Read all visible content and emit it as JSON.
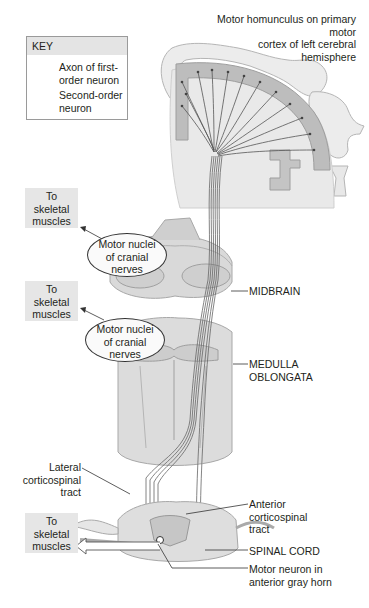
{
  "figure": {
    "title_label": "Motor homunculus on primary motor cortex of left cerebral hemisphere",
    "title_lines": [
      "Motor homunculus on primary motor",
      "cortex of left cerebral",
      "hemisphere"
    ]
  },
  "key": {
    "heading": "KEY",
    "items": [
      {
        "icon": "solid-arrow-icon",
        "lines": [
          "Axon of first-",
          "order neuron"
        ]
      },
      {
        "icon": "hollow-arrow-icon",
        "lines": [
          "Second-order",
          "neuron"
        ]
      }
    ]
  },
  "targets": [
    {
      "lines": [
        "To",
        "skeletal",
        "muscles"
      ]
    },
    {
      "lines": [
        "To",
        "skeletal",
        "muscles"
      ]
    },
    {
      "lines": [
        "To",
        "skeletal",
        "muscles"
      ]
    }
  ],
  "nuclei": [
    {
      "lines": [
        "Motor nuclei",
        "of cranial",
        "nerves"
      ]
    },
    {
      "lines": [
        "Motor nuclei",
        "of cranial",
        "nerves"
      ]
    }
  ],
  "structures": {
    "midbrain": "MIDBRAIN",
    "medulla": [
      "MEDULLA",
      "OBLONGATA"
    ],
    "lateral_tract": [
      "Lateral",
      "corticospinal",
      "tract"
    ],
    "anterior_tract": [
      "Anterior",
      "corticospinal",
      "tract"
    ],
    "spinal_cord": "SPINAL CORD",
    "motor_neuron": [
      "Motor neuron in",
      "anterior gray horn"
    ]
  },
  "colors": {
    "text": "#231f20",
    "box_fill": "#e6e6e6",
    "tissue_light": "#e2e2e2",
    "tissue_mid": "#c8c8c8",
    "cortex_gray": "#a9a9a9",
    "axon": "#555555"
  }
}
